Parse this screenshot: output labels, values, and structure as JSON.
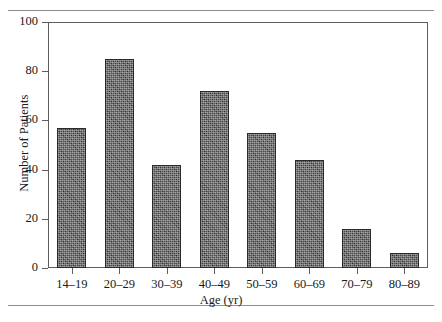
{
  "figure": {
    "rules": {
      "top": "",
      "bottom": ""
    }
  },
  "chart_data": {
    "type": "bar",
    "title": "",
    "xlabel": "Age (yr)",
    "ylabel": "Number of Patients",
    "categories": [
      "14–19",
      "20–29",
      "30–39",
      "40–49",
      "50–59",
      "60–69",
      "70–79",
      "80–89"
    ],
    "values": [
      57,
      85,
      42,
      72,
      55,
      44,
      16,
      6
    ],
    "ylim": [
      0,
      100
    ],
    "yticks": [
      0,
      20,
      40,
      60,
      80,
      100
    ],
    "ytick_labels": [
      "0",
      "20",
      "40",
      "60",
      "80",
      "100"
    ],
    "grid": false,
    "legend": null,
    "bar_fill_color": "#3c3c3c",
    "bar_edge_color": "#2a2a2a",
    "axis_color": "#5d5d5d",
    "background_color": "#ffffff"
  }
}
